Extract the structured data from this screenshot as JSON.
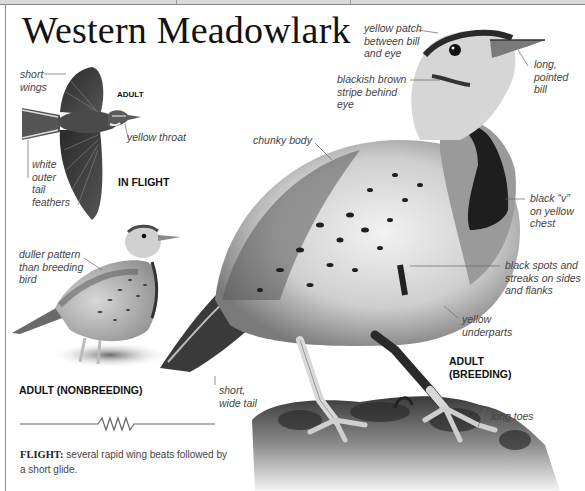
{
  "page": {
    "title": "Western Meadowlark"
  },
  "flight_illustration": {
    "heading_age": "ADULT",
    "heading_view": "IN FLIGHT",
    "labels": {
      "short_wings": "short wings",
      "yellow_throat": "yellow throat",
      "white_outer_tail": "white outer tail feathers"
    }
  },
  "nonbreeding_illustration": {
    "heading": "ADULT (NONBREEDING)",
    "labels": {
      "duller_pattern": "duller pattern than breeding bird"
    }
  },
  "breeding_illustration": {
    "heading_line1": "ADULT",
    "heading_line2": "(BREEDING)",
    "labels": {
      "yellow_patch": "yellow patch between bill and eye",
      "long_bill": "long, pointed bill",
      "blackish_stripe": "blackish brown stripe behind eye",
      "chunky_body": "chunky body",
      "black_v": "black “v” on yellow chest",
      "black_spots": "black spots and streaks on sides and flanks",
      "yellow_underparts": "yellow underparts",
      "short_tail": "short, wide tail",
      "long_toes": "long toes"
    }
  },
  "flight_pattern": {
    "icon": "flight-path-zigzag-icon",
    "label": "FLIGHT:",
    "description": "several rapid wing beats followed by a short glide."
  },
  "colors": {
    "border": "#8a8a8a",
    "title": "#111111",
    "label_text": "#444444",
    "leader_lines": "#666666"
  }
}
